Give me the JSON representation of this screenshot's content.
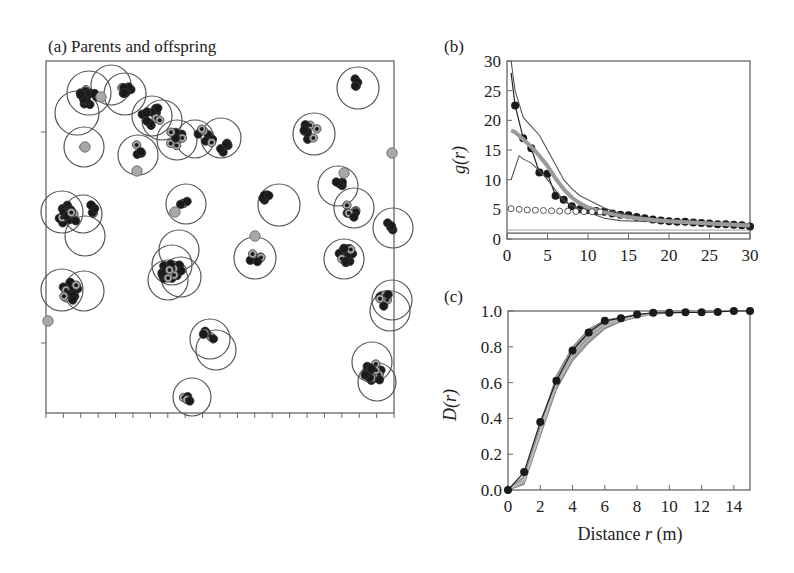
{
  "chart_data": [
    {
      "panel": "a",
      "type": "scatter",
      "title": "(a) Parents and offspring",
      "description": "Spatial map of parent circles (cluster radius) with offspring points (black) and parents (grey)",
      "frame": {
        "x0": 46,
        "y0": 61,
        "x1": 394,
        "y1": 413
      },
      "x_ticks_count": 20,
      "y_ticks": [
        132,
        343
      ],
      "circles": [
        {
          "cx": 89,
          "cy": 93,
          "r": 22
        },
        {
          "cx": 111,
          "cy": 85,
          "r": 20
        },
        {
          "cx": 77,
          "cy": 113,
          "r": 22
        },
        {
          "cx": 84,
          "cy": 147,
          "r": 20
        },
        {
          "cx": 125,
          "cy": 94,
          "r": 21
        },
        {
          "cx": 152,
          "cy": 116,
          "r": 20
        },
        {
          "cx": 162,
          "cy": 120,
          "r": 20
        },
        {
          "cx": 138,
          "cy": 155,
          "r": 20
        },
        {
          "cx": 177,
          "cy": 140,
          "r": 20
        },
        {
          "cx": 195,
          "cy": 139,
          "r": 19
        },
        {
          "cx": 221,
          "cy": 138,
          "r": 20
        },
        {
          "cx": 314,
          "cy": 134,
          "r": 21
        },
        {
          "cx": 358,
          "cy": 88,
          "r": 21
        },
        {
          "cx": 338,
          "cy": 186,
          "r": 20
        },
        {
          "cx": 354,
          "cy": 208,
          "r": 20
        },
        {
          "cx": 393,
          "cy": 228,
          "r": 20
        },
        {
          "cx": 186,
          "cy": 204,
          "r": 20
        },
        {
          "cx": 279,
          "cy": 205,
          "r": 21
        },
        {
          "cx": 62,
          "cy": 212,
          "r": 21
        },
        {
          "cx": 83,
          "cy": 214,
          "r": 19
        },
        {
          "cx": 85,
          "cy": 236,
          "r": 20
        },
        {
          "cx": 179,
          "cy": 250,
          "r": 20
        },
        {
          "cx": 172,
          "cy": 265,
          "r": 20
        },
        {
          "cx": 181,
          "cy": 277,
          "r": 20
        },
        {
          "cx": 168,
          "cy": 280,
          "r": 20
        },
        {
          "cx": 255,
          "cy": 258,
          "r": 21
        },
        {
          "cx": 344,
          "cy": 259,
          "r": 20
        },
        {
          "cx": 62,
          "cy": 290,
          "r": 21
        },
        {
          "cx": 84,
          "cy": 291,
          "r": 20
        },
        {
          "cx": 392,
          "cy": 300,
          "r": 20
        },
        {
          "cx": 390,
          "cy": 311,
          "r": 20
        },
        {
          "cx": 210,
          "cy": 339,
          "r": 20
        },
        {
          "cx": 216,
          "cy": 350,
          "r": 20
        },
        {
          "cx": 372,
          "cy": 362,
          "r": 20
        },
        {
          "cx": 377,
          "cy": 382,
          "r": 19
        },
        {
          "cx": 192,
          "cy": 397,
          "r": 19
        }
      ],
      "offspring_clusters": [
        {
          "cx": 88,
          "cy": 97,
          "n": 14,
          "spread": 9
        },
        {
          "cx": 127,
          "cy": 88,
          "n": 7,
          "spread": 8
        },
        {
          "cx": 150,
          "cy": 115,
          "n": 12,
          "spread": 11
        },
        {
          "cx": 176,
          "cy": 138,
          "n": 8,
          "spread": 8
        },
        {
          "cx": 205,
          "cy": 137,
          "n": 7,
          "spread": 9
        },
        {
          "cx": 223,
          "cy": 147,
          "n": 5,
          "spread": 6
        },
        {
          "cx": 311,
          "cy": 131,
          "n": 9,
          "spread": 9
        },
        {
          "cx": 355,
          "cy": 82,
          "n": 4,
          "spread": 5
        },
        {
          "cx": 339,
          "cy": 184,
          "n": 4,
          "spread": 4
        },
        {
          "cx": 353,
          "cy": 210,
          "n": 8,
          "spread": 8
        },
        {
          "cx": 390,
          "cy": 226,
          "n": 5,
          "spread": 5
        },
        {
          "cx": 184,
          "cy": 203,
          "n": 4,
          "spread": 4
        },
        {
          "cx": 266,
          "cy": 198,
          "n": 5,
          "spread": 4
        },
        {
          "cx": 68,
          "cy": 215,
          "n": 16,
          "spread": 10
        },
        {
          "cx": 90,
          "cy": 210,
          "n": 6,
          "spread": 6
        },
        {
          "cx": 172,
          "cy": 273,
          "n": 28,
          "spread": 11
        },
        {
          "cx": 255,
          "cy": 257,
          "n": 6,
          "spread": 6
        },
        {
          "cx": 346,
          "cy": 255,
          "n": 18,
          "spread": 8
        },
        {
          "cx": 70,
          "cy": 292,
          "n": 14,
          "spread": 11
        },
        {
          "cx": 386,
          "cy": 300,
          "n": 7,
          "spread": 7
        },
        {
          "cx": 207,
          "cy": 338,
          "n": 7,
          "spread": 7
        },
        {
          "cx": 374,
          "cy": 373,
          "n": 16,
          "spread": 10
        },
        {
          "cx": 186,
          "cy": 400,
          "n": 4,
          "spread": 4
        },
        {
          "cx": 138,
          "cy": 150,
          "n": 4,
          "spread": 6
        },
        {
          "cx": 84,
          "cy": 147,
          "n": 1,
          "spread": 0
        }
      ],
      "parents": [
        {
          "x": 392,
          "y": 153
        },
        {
          "x": 255,
          "y": 236
        },
        {
          "x": 48,
          "y": 321
        },
        {
          "x": 85,
          "y": 147
        },
        {
          "x": 101,
          "y": 97
        },
        {
          "x": 137,
          "y": 171
        },
        {
          "x": 344,
          "y": 173
        },
        {
          "x": 175,
          "y": 212
        }
      ]
    },
    {
      "panel": "b",
      "type": "line",
      "title": "(b)",
      "xlabel": "",
      "ylabel": "g(r)",
      "xlim": [
        0,
        30
      ],
      "ylim": [
        0,
        30
      ],
      "x_ticks": [
        0,
        5,
        10,
        15,
        20,
        25,
        30
      ],
      "y_ticks": [
        0,
        5,
        10,
        15,
        20,
        25,
        30
      ],
      "series": [
        {
          "name": "observed (filled circles)",
          "style": "line-markers-filled",
          "x": [
            1,
            2,
            3,
            4,
            5,
            6,
            7,
            8,
            9,
            10,
            11,
            12,
            13,
            14,
            15,
            16,
            17,
            18,
            19,
            20,
            21,
            22,
            23,
            24,
            25,
            26,
            27,
            28,
            29,
            30
          ],
          "y": [
            22.5,
            17,
            15.3,
            11.2,
            11,
            7.3,
            6.6,
            5.5,
            5,
            4.9,
            4.7,
            4.6,
            4.3,
            4.1,
            4,
            3.7,
            3.5,
            3.3,
            3.1,
            3,
            2.9,
            2.9,
            2.8,
            2.7,
            2.6,
            2.5,
            2.5,
            2.4,
            2.3,
            2.1
          ]
        },
        {
          "name": "upper envelope",
          "style": "thin-line",
          "x": [
            0.5,
            1,
            2,
            3,
            4,
            5,
            6,
            7,
            8,
            9,
            10,
            12,
            14,
            16,
            18,
            20,
            25,
            30
          ],
          "y": [
            30,
            25,
            20.5,
            19,
            17.5,
            15,
            12.5,
            10,
            8.5,
            7.3,
            6.6,
            5.2,
            4.3,
            3.8,
            3.5,
            3.2,
            2.8,
            2.5
          ]
        },
        {
          "name": "lower envelope",
          "style": "thin-line",
          "x": [
            0.5,
            1.5,
            2,
            3,
            4,
            5,
            6,
            7,
            8,
            9,
            10,
            12,
            14,
            16,
            18,
            20,
            25,
            30
          ],
          "y": [
            10,
            14,
            13.5,
            12.8,
            11.5,
            10,
            8.2,
            6.5,
            5.6,
            5,
            4.5,
            3.5,
            3.1,
            3,
            2.9,
            2.8,
            2.5,
            2.3
          ]
        },
        {
          "name": "model mean (thick grey)",
          "style": "thick-grey",
          "x": [
            0.5,
            1,
            2,
            3,
            4,
            5,
            6,
            7,
            8,
            9,
            10,
            12,
            14,
            16,
            18,
            20,
            25,
            30
          ],
          "y": [
            18.3,
            18,
            16.8,
            15.5,
            14,
            12.3,
            10.2,
            8.4,
            7,
            6,
            5.3,
            4.5,
            3.9,
            3.5,
            3.2,
            3,
            2.6,
            2.3
          ]
        },
        {
          "name": "open circles",
          "style": "markers-open",
          "x": [
            0.5,
            1.5,
            2.5,
            3.5,
            4.5,
            5.5,
            6.5,
            7.5,
            8.5,
            9.5,
            10.5,
            11.5
          ],
          "y": [
            5.1,
            5,
            4.9,
            4.85,
            4.8,
            4.75,
            4.7,
            4.7,
            4.65,
            4.6,
            4.6,
            4.55
          ]
        },
        {
          "name": "reference g=1",
          "style": "hline",
          "y": 1
        }
      ]
    },
    {
      "panel": "c",
      "type": "line",
      "title": "(c)",
      "xlabel": "Distance r (m)",
      "ylabel": "D(r)",
      "xlim": [
        0,
        15
      ],
      "ylim": [
        0,
        1
      ],
      "x_ticks": [
        0,
        2,
        4,
        6,
        8,
        10,
        12,
        14
      ],
      "y_ticks": [
        "0.0",
        "0.2",
        "0.4",
        "0.6",
        "0.8",
        "1.0"
      ],
      "series": [
        {
          "name": "observed (filled circles)",
          "style": "line-markers-filled",
          "x": [
            0,
            1,
            2,
            3,
            4,
            5,
            6,
            7,
            8,
            9,
            10,
            11,
            12,
            13,
            14,
            15
          ],
          "y": [
            0,
            0.1,
            0.38,
            0.61,
            0.78,
            0.88,
            0.945,
            0.96,
            0.98,
            0.99,
            0.99,
            0.993,
            0.993,
            0.995,
            1.0,
            1.0
          ]
        },
        {
          "name": "simulation upper",
          "style": "grey-band",
          "x": [
            0,
            1,
            2,
            3,
            4,
            5,
            6,
            7,
            8,
            9,
            10,
            12,
            15
          ],
          "y": [
            0,
            0.08,
            0.36,
            0.64,
            0.8,
            0.9,
            0.95,
            0.965,
            0.98,
            0.99,
            0.995,
            0.998,
            1.0
          ]
        },
        {
          "name": "simulation lower",
          "style": "grey-band",
          "x": [
            0,
            1,
            2,
            3,
            4,
            5,
            6,
            7,
            8,
            9,
            10,
            12,
            15
          ],
          "y": [
            0,
            0.03,
            0.3,
            0.56,
            0.72,
            0.82,
            0.9,
            0.94,
            0.965,
            0.98,
            0.99,
            0.996,
            1.0
          ]
        }
      ]
    }
  ],
  "labels": {
    "panel_a": "(a) Parents and offspring",
    "panel_b": "(b)",
    "panel_c": "(c)",
    "b_ylabel": "g(r)",
    "c_ylabel": "D(r)",
    "c_xlabel_pre": "Distance ",
    "c_xlabel_var": "r",
    "c_xlabel_post": " (m)"
  },
  "colors": {
    "ink": "#1a1a1a",
    "frame": "#666666",
    "circle": "#555555",
    "parent_fill": "#a8a8a8",
    "thick_grey": "#9a9a9a",
    "envelope": "#555555",
    "band": "#8c8c8c"
  }
}
